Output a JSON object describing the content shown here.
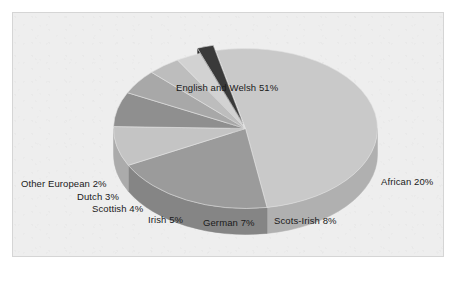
{
  "figure": {
    "background_color": "#eeeeee",
    "frame_border_color": "#d5d5d5",
    "caption_artifact": ""
  },
  "chart_data": {
    "type": "pie",
    "title": "",
    "subtitle": "",
    "xlabel": "",
    "ylabel": "",
    "style": "3d-exploded-grayscale",
    "legend_position": "none",
    "labels_inline": true,
    "units": "percent",
    "total": 100,
    "categories": [
      "English and Welsh",
      "African",
      "Scots-Irish",
      "German",
      "Irish",
      "Scottish",
      "Dutch",
      "Other European"
    ],
    "values": [
      51,
      20,
      8,
      7,
      5,
      4,
      3,
      2
    ],
    "slices": [
      {
        "name": "English and Welsh",
        "value": 51,
        "label": "English and Welsh 51%",
        "top_color": "#c9c9c9",
        "side_color": "#b0b0b0"
      },
      {
        "name": "African",
        "value": 20,
        "label": "African 20%",
        "top_color": "#9b9b9b",
        "side_color": "#858585"
      },
      {
        "name": "Scots-Irish",
        "value": 8,
        "label": "Scots-Irish 8%",
        "top_color": "#c4c4c4",
        "side_color": "#ababab"
      },
      {
        "name": "German",
        "value": 7,
        "label": "German 7%",
        "top_color": "#8f8f8f",
        "side_color": "#7a7a7a"
      },
      {
        "name": "Irish",
        "value": 5,
        "label": "Irish 5%",
        "top_color": "#a8a8a8",
        "side_color": "#929292"
      },
      {
        "name": "Scottish",
        "value": 4,
        "label": "Scottish 4%",
        "top_color": "#bdbdbd",
        "side_color": "#a4a4a4"
      },
      {
        "name": "Dutch",
        "value": 3,
        "label": "Dutch 3%",
        "top_color": "#d2d2d2",
        "side_color": "#b8b8b8"
      },
      {
        "name": "Other European",
        "value": 2,
        "label": "Other European 2%",
        "top_color": "#3a3a3a",
        "side_color": "#2a2a2a"
      }
    ]
  }
}
